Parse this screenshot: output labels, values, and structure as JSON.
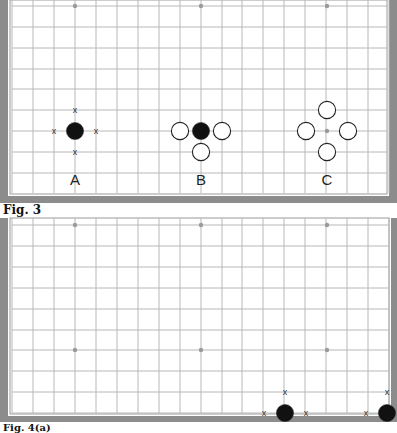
{
  "figures": [
    {
      "caption": "Fig. 3",
      "labels": [
        "A",
        "B",
        "C"
      ],
      "board": {
        "frame_color": "#8c8c8c",
        "grid_color": "#b4b4b4",
        "star_points": [
          [
            75,
            6
          ],
          [
            201,
            6
          ],
          [
            327,
            6
          ],
          [
            327,
            131
          ]
        ],
        "stones": [
          {
            "color": "black",
            "x": 75,
            "y": 131
          },
          {
            "color": "black",
            "x": 201,
            "y": 131
          },
          {
            "color": "white",
            "x": 180,
            "y": 131
          },
          {
            "color": "white",
            "x": 222,
            "y": 131
          },
          {
            "color": "white",
            "x": 201,
            "y": 152
          },
          {
            "color": "white",
            "x": 327,
            "y": 110
          },
          {
            "color": "white",
            "x": 306,
            "y": 131
          },
          {
            "color": "white",
            "x": 348,
            "y": 131
          },
          {
            "color": "white",
            "x": 327,
            "y": 152
          }
        ],
        "marks": [
          {
            "symbol": "x",
            "x": 75,
            "y": 110
          },
          {
            "symbol": "x",
            "x": 54,
            "y": 131
          },
          {
            "symbol": "x",
            "x": 96,
            "y": 131
          },
          {
            "symbol": "x",
            "x": 75,
            "y": 152
          }
        ]
      }
    },
    {
      "caption": "Fig. 4(a)",
      "board": {
        "star_points": [
          [
            75,
            225
          ],
          [
            201,
            225
          ],
          [
            327,
            225
          ],
          [
            75,
            350
          ],
          [
            201,
            350
          ],
          [
            327,
            350
          ]
        ],
        "stones": [
          {
            "color": "black",
            "x": 285,
            "y": 413
          },
          {
            "color": "black",
            "x": 387,
            "y": 413
          }
        ],
        "marks": [
          {
            "symbol": "x",
            "x": 285,
            "y": 392
          },
          {
            "symbol": "x",
            "x": 264,
            "y": 413
          },
          {
            "symbol": "x",
            "x": 306,
            "y": 413
          },
          {
            "symbol": "x",
            "x": 387,
            "y": 392
          },
          {
            "symbol": "x",
            "x": 366,
            "y": 413
          }
        ]
      }
    }
  ]
}
